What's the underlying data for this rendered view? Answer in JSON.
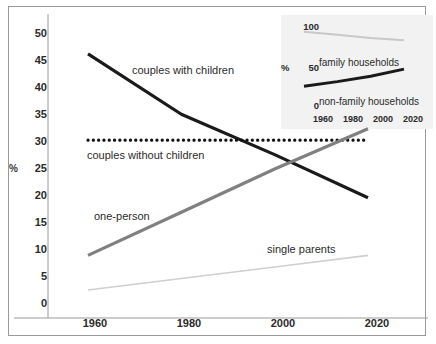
{
  "chart_data": [
    {
      "type": "line",
      "id": "main",
      "title": "",
      "xlabel": "",
      "ylabel": "%",
      "x": [
        1960,
        1980,
        2000,
        2020
      ],
      "xlim": [
        1960,
        2020
      ],
      "ylim": [
        0,
        50
      ],
      "yticks": [
        0,
        5,
        10,
        15,
        20,
        25,
        30,
        35,
        40,
        45,
        50
      ],
      "xticks": [
        "1960",
        "1980",
        "2000",
        "2020"
      ],
      "grid": false,
      "legend_position": "inline-annotations",
      "series": [
        {
          "name": "couples with children",
          "color": "#1a1a1a",
          "style": "solid",
          "values": [
            45,
            34.5,
            27.5,
            20
          ]
        },
        {
          "name": "couples without children",
          "color": "#111111",
          "style": "dotted",
          "values": [
            30,
            30,
            30,
            30
          ]
        },
        {
          "name": "one-person",
          "color": "#808080",
          "style": "solid",
          "values": [
            10,
            17.5,
            25,
            32
          ]
        },
        {
          "name": "single parents",
          "color": "#cfcfcf",
          "style": "solid",
          "values": [
            4,
            6,
            8,
            10
          ]
        }
      ]
    },
    {
      "type": "line",
      "id": "inset",
      "title": "",
      "xlabel": "",
      "ylabel": "%",
      "x": [
        1960,
        1980,
        2000,
        2020
      ],
      "xlim": [
        1960,
        2020
      ],
      "ylim": [
        0,
        100
      ],
      "yticks": [
        0,
        50,
        100
      ],
      "xticks": [
        "1960",
        "1980",
        "2000",
        "2020"
      ],
      "grid": false,
      "legend_position": "inline-annotations",
      "series": [
        {
          "name": "family households",
          "color": "#c8c8c8",
          "style": "solid",
          "values": [
            85,
            81,
            77,
            74
          ]
        },
        {
          "name": "non-family households",
          "color": "#1a1a1a",
          "style": "solid",
          "values": [
            15,
            21,
            28,
            37
          ]
        }
      ]
    }
  ],
  "main": {
    "y_axis_title": "%",
    "y_ticks": [
      "50",
      "45",
      "40",
      "35",
      "30",
      "25",
      "20",
      "15",
      "10",
      "5",
      "0"
    ],
    "x_ticks": [
      "1960",
      "1980",
      "2000",
      "2020"
    ],
    "annotations": {
      "couples_with_children": "couples with children",
      "couples_without_children": "couples without children",
      "one_person": "one-person",
      "single_parents": "single parents"
    }
  },
  "inset": {
    "y_axis_title": "%",
    "y_ticks": [
      "100",
      "50",
      "0"
    ],
    "x_ticks": [
      "1960",
      "1980",
      "2000",
      "2020"
    ],
    "annotations": {
      "family_households": "family households",
      "non_family_households": "non-family households"
    }
  }
}
